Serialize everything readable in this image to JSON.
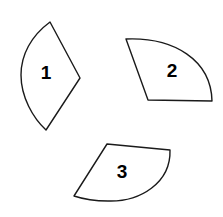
{
  "figure": {
    "background_color": "#ffffff",
    "stroke_color": "#1a1a1a",
    "fill_color": "#ffffff",
    "label_color": "#000000",
    "canvas": {
      "width": 223,
      "height": 217
    }
  },
  "shapes": [
    {
      "id": "shape-1",
      "label": "1",
      "label_x": 46,
      "label_y": 74,
      "description": "lens shaped piece with curved left edge and pointed right vertex",
      "path": "M 50 22 C 31 36 21 55 21 75 C 21 97 33 118 46 130 L 80 78 Z"
    },
    {
      "id": "shape-2",
      "label": "2",
      "label_x": 172,
      "label_y": 72,
      "description": "quarter circle sector opening to the lower left",
      "path": "M 126 39 C 174 37 211 60 212 101 L 148 100 Z"
    },
    {
      "id": "shape-3",
      "label": "3",
      "label_x": 122,
      "label_y": 173,
      "description": "rotated sector with curved lower right edge",
      "path": "M 107 144 L 170 150 C 171 183 140 202 108 201 C 95 201 83 199 74 196 Z"
    }
  ]
}
